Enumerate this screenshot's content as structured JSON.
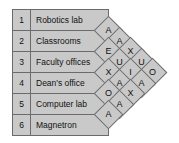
{
  "chart_data": {
    "type": "table",
    "title": "",
    "kind": "activity-relationship-chart",
    "activities": [
      {
        "number": "1",
        "name": "Robotics lab"
      },
      {
        "number": "2",
        "name": "Classrooms"
      },
      {
        "number": "3",
        "name": "Faculty offices"
      },
      {
        "number": "4",
        "name": "Dean's office"
      },
      {
        "number": "5",
        "name": "Computer lab"
      },
      {
        "number": "6",
        "name": "Magnetron"
      }
    ],
    "relationship_codes": [
      "A",
      "E",
      "I",
      "O",
      "U",
      "X"
    ],
    "diagonals": [
      {
        "offset": 1,
        "ratings": [
          "A",
          "E",
          "X",
          "O",
          "A"
        ]
      },
      {
        "offset": 2,
        "ratings": [
          "A",
          "X",
          "U",
          "A",
          "A"
        ]
      },
      {
        "offset": 3,
        "ratings": [
          "U",
          "I",
          "X"
        ]
      },
      {
        "offset": 4,
        "ratings": [
          "U",
          "A"
        ]
      },
      {
        "offset": 5,
        "ratings": [
          "O"
        ]
      }
    ],
    "pairs": [
      {
        "from": "1",
        "to": "2",
        "rating": "A"
      },
      {
        "from": "2",
        "to": "3",
        "rating": "E"
      },
      {
        "from": "3",
        "to": "4",
        "rating": "X"
      },
      {
        "from": "4",
        "to": "5",
        "rating": "O"
      },
      {
        "from": "5",
        "to": "6",
        "rating": "A"
      },
      {
        "from": "1",
        "to": "3",
        "rating": "A"
      },
      {
        "from": "2",
        "to": "4",
        "rating": "X"
      },
      {
        "from": "3",
        "to": "5",
        "rating": "U"
      },
      {
        "from": "4",
        "to": "6",
        "rating": "A"
      },
      {
        "from": "1",
        "to": "4",
        "rating": "U"
      },
      {
        "from": "2",
        "to": "5",
        "rating": "I"
      },
      {
        "from": "3",
        "to": "6",
        "rating": "X"
      },
      {
        "from": "1",
        "to": "5",
        "rating": "U"
      },
      {
        "from": "2",
        "to": "6",
        "rating": "A"
      },
      {
        "from": "1",
        "to": "6",
        "rating": "O"
      }
    ]
  },
  "table": {
    "rows": [
      {
        "number": "1",
        "name": "Robotics lab"
      },
      {
        "number": "2",
        "name": "Classrooms"
      },
      {
        "number": "3",
        "name": "Faculty offices"
      },
      {
        "number": "4",
        "name": "Dean's office"
      },
      {
        "number": "5",
        "name": "Computer lab"
      },
      {
        "number": "6",
        "name": "Magnetron"
      }
    ]
  },
  "lattice": {
    "cells": [
      {
        "x": 11,
        "y": 21,
        "label": "A"
      },
      {
        "x": 22,
        "y": 32,
        "label": "A"
      },
      {
        "x": 11,
        "y": 42,
        "label": "E"
      },
      {
        "x": 33,
        "y": 42,
        "label": "X"
      },
      {
        "x": 22,
        "y": 53,
        "label": "U"
      },
      {
        "x": 44,
        "y": 53,
        "label": "U"
      },
      {
        "x": 11,
        "y": 63,
        "label": "X"
      },
      {
        "x": 33,
        "y": 63,
        "label": "I"
      },
      {
        "x": 55,
        "y": 63,
        "label": "O"
      },
      {
        "x": 22,
        "y": 74,
        "label": "A"
      },
      {
        "x": 44,
        "y": 74,
        "label": "A"
      },
      {
        "x": 11,
        "y": 84,
        "label": "O"
      },
      {
        "x": 33,
        "y": 84,
        "label": "X"
      },
      {
        "x": 22,
        "y": 95,
        "label": "A"
      },
      {
        "x": 11,
        "y": 105,
        "label": "A"
      }
    ]
  },
  "colors": {
    "fill": "#c9c9c9",
    "stroke": "#6b6b6b",
    "text": "#111111",
    "background": "#ffffff"
  }
}
